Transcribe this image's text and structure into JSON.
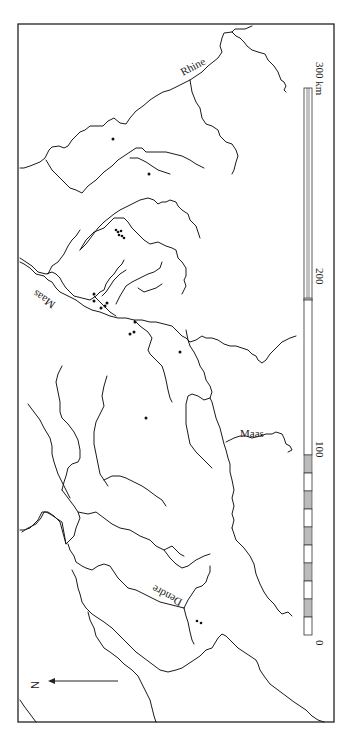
{
  "map": {
    "labels": {
      "rhine": "Rhine",
      "maas_upper": "Maas",
      "maas_lower": "Maas",
      "dendre": "Dendre"
    },
    "north_arrow": {
      "label": "N",
      "direction": "left"
    },
    "scale_bar": {
      "unit": "km",
      "ticks": [
        "0",
        "100",
        "200",
        "300 km"
      ],
      "values_km": [
        0,
        100,
        200,
        300
      ]
    },
    "sites": {
      "count_approx": 22,
      "groups": [
        {
          "name": "site-upper-single",
          "count": 1
        },
        {
          "name": "site-upper-second",
          "count": 1
        },
        {
          "name": "site-cluster-north",
          "count": 6
        },
        {
          "name": "site-cluster-maas-bend",
          "count": 5
        },
        {
          "name": "site-cluster-confluence",
          "count": 3
        },
        {
          "name": "site-middle-single",
          "count": 1
        },
        {
          "name": "site-center-single",
          "count": 1
        },
        {
          "name": "site-dendre-pair",
          "count": 2
        }
      ]
    },
    "colors": {
      "ink": "#1a1a1a",
      "paper": "#ffffff",
      "scale_fill": "#bbbbbb"
    }
  }
}
